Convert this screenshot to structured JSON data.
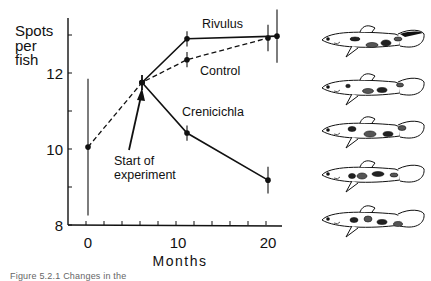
{
  "chart_data": {
    "type": "line",
    "title": "",
    "xlabel": "Months",
    "ylabel": "Spots per fish",
    "ylabel_lines": [
      "Spots",
      "per",
      "fish"
    ],
    "xlim": [
      0,
      22
    ],
    "ylim": [
      8,
      13.4
    ],
    "xticks_labeled": [
      0,
      10,
      20
    ],
    "xtick_minor_step": 2,
    "yticks_labeled": [
      8,
      10,
      12
    ],
    "ytick_minor_step": 1,
    "grid": false,
    "legend": "direct labels on lines",
    "series": [
      {
        "name": "Rivulus",
        "style": "solid",
        "points": [
          {
            "x": 6,
            "y": 11.75,
            "err": 0.2
          },
          {
            "x": 11,
            "y": 12.9,
            "err": 0.2
          },
          {
            "x": 21,
            "y": 12.97,
            "err": 0.7
          }
        ]
      },
      {
        "name": "Control",
        "style": "dashed",
        "points": [
          {
            "x": 0,
            "y": 10.05,
            "err": 1.8
          },
          {
            "x": 6,
            "y": 11.75,
            "err": 0.2
          },
          {
            "x": 11,
            "y": 12.35,
            "err": 0.2
          },
          {
            "x": 20,
            "y": 12.92,
            "err": 0.35
          }
        ]
      },
      {
        "name": "Crenicichla",
        "style": "solid",
        "points": [
          {
            "x": 6,
            "y": 11.75,
            "err": 0.2
          },
          {
            "x": 11,
            "y": 10.42,
            "err": 0.2
          },
          {
            "x": 20,
            "y": 9.18,
            "err": 0.35
          }
        ]
      }
    ],
    "annotations": [
      {
        "text_lines": [
          "Start of",
          "experiment"
        ],
        "arrow_to": {
          "x": 6,
          "y": 11.75
        }
      }
    ],
    "labels": {
      "rivulus": "Rivulus",
      "control": "Control",
      "crenicichla": "Crenicichla"
    }
  },
  "illustrations": {
    "description": "Five guppy drawings showing spot patterns",
    "count": 5
  },
  "caption": "Figure 5.2.1 Changes in the"
}
